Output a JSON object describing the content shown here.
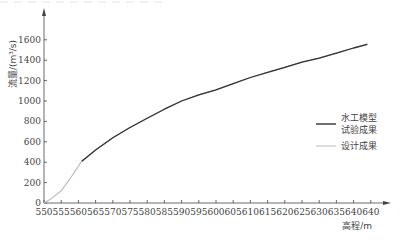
{
  "chart_data": {
    "type": "line",
    "title": "",
    "xlabel": "高程/m",
    "ylabel": "流量/(m³/s)",
    "xlim": [
      550,
      645
    ],
    "ylim": [
      0,
      1700
    ],
    "x_tick_labels": [
      "550",
      "555",
      "560",
      "565",
      "570",
      "575",
      "580",
      "585",
      "590",
      "595",
      "600",
      "605",
      "610",
      "615",
      "620",
      "625",
      "630",
      "635",
      "640",
      "640"
    ],
    "y_tick_labels": [
      "0",
      "200",
      "400",
      "600",
      "800",
      "1000",
      "1200",
      "1400",
      "1600"
    ],
    "grid": false,
    "legend_position": "right-middle",
    "series": [
      {
        "name": "水工模型试验成果",
        "color": "#333333",
        "points": [
          [
            561,
            410
          ],
          [
            565,
            520
          ],
          [
            570,
            640
          ],
          [
            575,
            740
          ],
          [
            580,
            830
          ],
          [
            585,
            920
          ],
          [
            590,
            1000
          ],
          [
            595,
            1060
          ],
          [
            600,
            1110
          ],
          [
            605,
            1170
          ],
          [
            610,
            1230
          ],
          [
            615,
            1280
          ],
          [
            620,
            1330
          ],
          [
            625,
            1380
          ],
          [
            630,
            1420
          ],
          [
            635,
            1470
          ],
          [
            640,
            1520
          ],
          [
            644,
            1555
          ]
        ]
      },
      {
        "name": "设计成果",
        "color": "#bbbbbb",
        "points": [
          [
            550,
            0
          ],
          [
            552,
            40
          ],
          [
            555,
            120
          ],
          [
            558,
            260
          ],
          [
            561,
            410
          ],
          [
            565,
            520
          ],
          [
            570,
            640
          ],
          [
            575,
            740
          ],
          [
            580,
            830
          ],
          [
            585,
            920
          ],
          [
            590,
            1000
          ],
          [
            595,
            1060
          ],
          [
            600,
            1110
          ],
          [
            605,
            1170
          ],
          [
            610,
            1230
          ],
          [
            615,
            1280
          ],
          [
            620,
            1330
          ],
          [
            625,
            1380
          ],
          [
            630,
            1420
          ],
          [
            635,
            1470
          ],
          [
            640,
            1520
          ],
          [
            644,
            1560
          ]
        ]
      }
    ]
  },
  "legend": {
    "model_line1": "水工模型",
    "model_line2": "试验成果",
    "design": "设计成果"
  },
  "axes": {
    "x_title": "高程/m",
    "y_title": "流量/(m³/s)"
  }
}
